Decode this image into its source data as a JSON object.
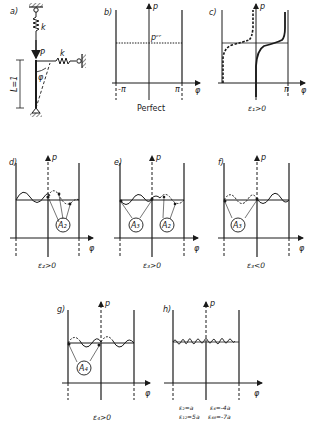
{
  "figure": {
    "panels": [
      {
        "id": "a",
        "tag": "a)",
        "spring_top": "k",
        "spring_side": "k",
        "load": "P",
        "length": "L=1",
        "angle": "φ"
      },
      {
        "id": "b",
        "tag": "b)",
        "y_axis": "p",
        "x_axis": "φ",
        "ticks": [
          "-π",
          "π"
        ],
        "critical": "pᶜʳ",
        "caption": "Perfect"
      },
      {
        "id": "c",
        "tag": "c)",
        "y_axis": "p",
        "x_axis": "φ",
        "ticks": [
          "π"
        ],
        "caption": "ε₁>0"
      },
      {
        "id": "d",
        "tag": "d)",
        "y_axis": "p",
        "x_axis": "φ",
        "bubble": "A₂",
        "caption": "ε₂>0"
      },
      {
        "id": "e",
        "tag": "e)",
        "y_axis": "p",
        "x_axis": "φ",
        "bubbles": [
          "A₃",
          "A₂"
        ],
        "caption": "ε₃>0"
      },
      {
        "id": "f",
        "tag": "f)",
        "y_axis": "p",
        "x_axis": "φ",
        "bubble": "A₃",
        "caption": "ε₃<0"
      },
      {
        "id": "g",
        "tag": "g)",
        "y_axis": "p",
        "x_axis": "φ",
        "bubble": "A₄",
        "caption": "ε₄>0"
      },
      {
        "id": "h",
        "tag": "h)",
        "y_axis": "p",
        "x_axis": "φ",
        "caption_line1_left": "ε₂=a",
        "caption_line1_right": "ε₄=-4a",
        "caption_line2_left": "ε₁₂=5a",
        "caption_line2_right": "ε₄₈=-7a"
      }
    ]
  },
  "colors": {
    "ink": "#1a1a1a",
    "background": "#ffffff"
  }
}
